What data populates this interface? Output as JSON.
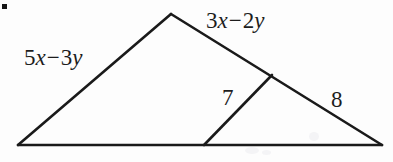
{
  "figure": {
    "background_color": "#fdfdfd",
    "stroke_color": "#1a1a1a",
    "bullet_marker": "▪",
    "labels": {
      "left_side": {
        "coeff1": "5",
        "var1": "x",
        "operator": "−",
        "coeff2": "3",
        "var2": "y",
        "full_text": "5x − 3y"
      },
      "top_right_side": {
        "coeff1": "3",
        "var1": "x",
        "operator": "−",
        "coeff2": "2",
        "var2": "y",
        "full_text": "3x − 2y"
      },
      "cevian": "7",
      "lower_right_side": "8"
    },
    "geometry": {
      "apex": [
        171,
        14
      ],
      "bottom_left": [
        18,
        145
      ],
      "bottom_right": [
        382,
        145
      ],
      "right_side_point": [
        272,
        75
      ],
      "base_point": [
        204,
        145
      ],
      "stroke_width": 2.6
    }
  }
}
